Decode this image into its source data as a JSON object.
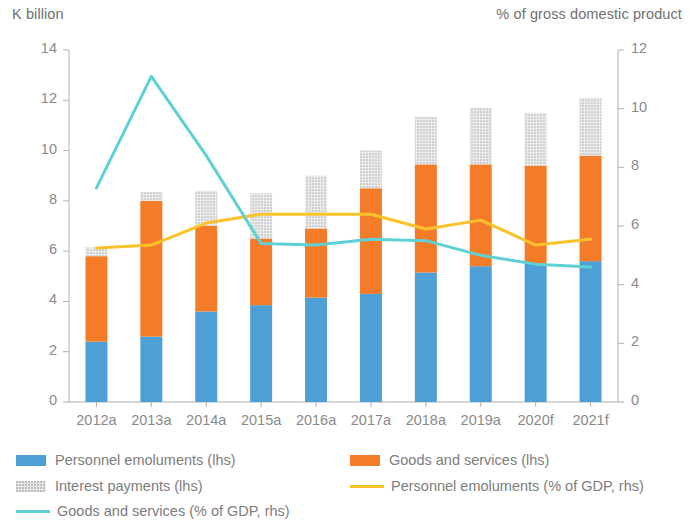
{
  "axes": {
    "left_title": "K billion",
    "right_title": "% of gross domestic product",
    "left_ticks": [
      "0",
      "2",
      "4",
      "6",
      "8",
      "10",
      "12",
      "14"
    ],
    "right_ticks": [
      "0",
      "2",
      "4",
      "6",
      "8",
      "10",
      "12"
    ]
  },
  "legend": {
    "items": [
      {
        "label": "Personnel emoluments (lhs)",
        "color": "#4d9fd4",
        "marker": "bar"
      },
      {
        "label": "Goods and services (lhs)",
        "color": "#f47c28",
        "marker": "bar"
      },
      {
        "label": "Interest payments (lhs)",
        "color": "#c9c9c9",
        "marker": "dotted"
      },
      {
        "label": "Personnel emoluments (% of GDP, rhs)",
        "color": "#fcc22a",
        "marker": "line"
      },
      {
        "label": "Goods and services (% of GDP, rhs)",
        "color": "#5ed0d6",
        "marker": "line"
      }
    ]
  },
  "chart_data": {
    "type": "bar",
    "title": "",
    "subtitle": "",
    "xlabel": "",
    "ylabel": "K billion",
    "y2label": "% of gross domestic product",
    "ylim": [
      0,
      14
    ],
    "y2lim": [
      0,
      12
    ],
    "grid": false,
    "legend_position": "bottom",
    "categories": [
      "2012a",
      "2013a",
      "2014a",
      "2015a",
      "2016a",
      "2017a",
      "2018a",
      "2019a",
      "2020f",
      "2021f"
    ],
    "series": [
      {
        "name": "Personnel emoluments (lhs)",
        "type": "bar",
        "stack": "expenditure",
        "axis": "left",
        "color": "#4d9fd4",
        "values": [
          2.4,
          2.6,
          3.6,
          3.85,
          4.15,
          4.3,
          5.15,
          5.4,
          5.5,
          5.6
        ]
      },
      {
        "name": "Goods and services (lhs)",
        "type": "bar",
        "stack": "expenditure",
        "axis": "left",
        "color": "#f47c28",
        "values": [
          3.4,
          5.4,
          3.4,
          2.65,
          2.75,
          4.2,
          4.3,
          4.05,
          3.9,
          4.2
        ]
      },
      {
        "name": "Interest payments (lhs)",
        "type": "bar",
        "stack": "expenditure",
        "axis": "left",
        "color": "#c9c9c9",
        "values": [
          0.35,
          0.35,
          1.4,
          1.8,
          2.1,
          1.5,
          1.9,
          2.25,
          2.1,
          2.3
        ]
      },
      {
        "name": "Personnel emoluments (% of GDP, rhs)",
        "type": "line",
        "axis": "right",
        "color": "#fcc22a",
        "values": [
          5.25,
          5.35,
          6.1,
          6.4,
          6.4,
          6.4,
          5.9,
          6.2,
          5.35,
          5.55
        ]
      },
      {
        "name": "Goods and services (% of GDP, rhs)",
        "type": "line",
        "axis": "right",
        "color": "#5ed0d6",
        "values": [
          7.3,
          11.1,
          8.4,
          5.4,
          5.35,
          5.55,
          5.5,
          5.0,
          4.7,
          4.6
        ]
      }
    ]
  }
}
